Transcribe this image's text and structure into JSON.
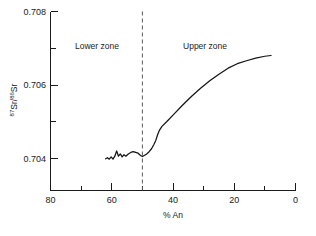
{
  "chart_data": {
    "type": "line",
    "title": "",
    "xlabel": "% An",
    "ylabel": "87Sr/86Sr",
    "ylabel_parts": {
      "sup1": "87",
      "mid": "Sr/",
      "sup2": "86",
      "end": "Sr"
    },
    "xlim": [
      80,
      0
    ],
    "ylim": [
      0.7032,
      0.708
    ],
    "x_reversed": true,
    "grid": false,
    "legend": "none",
    "x_major_ticks": [
      80,
      60,
      40,
      20,
      0
    ],
    "x_major_tick_labels": [
      "80",
      "60",
      "40",
      "20",
      "0"
    ],
    "x_minor_ticks": [
      70,
      50,
      30,
      10
    ],
    "y_major_ticks": [
      0.708,
      0.706,
      0.704
    ],
    "y_major_tick_labels": [
      "0.708",
      "0.706",
      "0.704"
    ],
    "y_minor_ticks": [
      0.707,
      0.705
    ],
    "annotations": [
      {
        "name": "lower-zone-label",
        "text": "Lower zone",
        "x": 62,
        "y": 0.7073
      },
      {
        "name": "upper-zone-label",
        "text": "Upper zone",
        "x": 33,
        "y": 0.7073
      }
    ],
    "reference_lines": [
      {
        "name": "zone-divider",
        "orientation": "vertical",
        "x": 50,
        "style": "dashed"
      }
    ],
    "series": [
      {
        "name": "Sr isotope ratio",
        "x": [
          62.0,
          61.4,
          60.8,
          60.2,
          59.6,
          59.0,
          58.4,
          57.8,
          57.2,
          56.6,
          56.0,
          55.4,
          54.6,
          53.8,
          53.0,
          52.2,
          51.4,
          50.6,
          50.0,
          49.4,
          48.6,
          47.8,
          47.0,
          46.2,
          45.6,
          45.0,
          44.4,
          43.6,
          42.0,
          40.0,
          37.0,
          34.0,
          31.0,
          28.0,
          25.0,
          22.0,
          19.0,
          16.0,
          13.0,
          10.0,
          8.0
        ],
        "y": [
          0.70405,
          0.70408,
          0.70404,
          0.7041,
          0.70404,
          0.70412,
          0.70426,
          0.70412,
          0.70418,
          0.7041,
          0.70416,
          0.70412,
          0.70418,
          0.70422,
          0.70424,
          0.70422,
          0.7042,
          0.70414,
          0.70411,
          0.70414,
          0.70418,
          0.70424,
          0.70432,
          0.70444,
          0.70455,
          0.7047,
          0.70482,
          0.70492,
          0.70505,
          0.70522,
          0.70548,
          0.70572,
          0.70594,
          0.70614,
          0.70632,
          0.70648,
          0.7066,
          0.70668,
          0.70675,
          0.7068,
          0.70682
        ]
      }
    ]
  },
  "caption": {
    "text": ""
  }
}
